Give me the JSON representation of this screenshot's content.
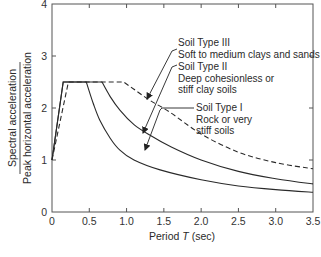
{
  "chart_data": {
    "type": "line",
    "title": "",
    "xlabel": "Period T (sec)",
    "xlabel_parts": {
      "prefix": "Period ",
      "italic": "T",
      "suffix": " (sec)"
    },
    "ylabel": "Spectral acceleration / Peak horizontal acceleration",
    "ylabel_numerator": "Spectral acceleration",
    "ylabel_denominator": "Peak horizontal acceleration",
    "xlim": [
      0,
      3.5
    ],
    "ylim": [
      0,
      4
    ],
    "xticks": [
      0,
      0.5,
      1.0,
      1.5,
      2.0,
      2.5,
      3.0,
      3.5
    ],
    "xtick_labels": [
      "0",
      "0.5",
      "1.0",
      "1.5",
      "2.0",
      "2.5",
      "3.0",
      "3.5"
    ],
    "yticks": [
      0,
      1,
      2,
      3,
      4
    ],
    "ytick_labels": [
      "0",
      "1",
      "2",
      "3",
      "4"
    ],
    "grid": false,
    "legend": "inline annotations with arrows",
    "series": [
      {
        "name": "Soil Type I",
        "description": "Rock or very stiff soils",
        "style": "solid",
        "points": [
          [
            0,
            1.0
          ],
          [
            0.15,
            2.5
          ],
          [
            0.46,
            2.5
          ],
          [
            0.55,
            2.1
          ],
          [
            0.64,
            1.77
          ],
          [
            0.78,
            1.42
          ],
          [
            0.91,
            1.19
          ],
          [
            1.1,
            1.0
          ],
          [
            1.45,
            0.81
          ],
          [
            2.0,
            0.62
          ],
          [
            2.5,
            0.5
          ],
          [
            3.0,
            0.43
          ],
          [
            3.5,
            0.38
          ]
        ]
      },
      {
        "name": "Soil Type II",
        "description": "Deep cohesionless or stiff clay soils",
        "style": "solid",
        "points": [
          [
            0,
            1.0
          ],
          [
            0.15,
            2.5
          ],
          [
            0.67,
            2.5
          ],
          [
            0.78,
            2.22
          ],
          [
            0.91,
            1.96
          ],
          [
            1.1,
            1.68
          ],
          [
            1.31,
            1.48
          ],
          [
            1.6,
            1.25
          ],
          [
            2.0,
            1.0
          ],
          [
            2.5,
            0.78
          ],
          [
            3.0,
            0.64
          ],
          [
            3.5,
            0.54
          ]
        ]
      },
      {
        "name": "Soil Type III",
        "description": "Soft to medium clays and sands",
        "style": "dashed",
        "points": [
          [
            0,
            1.0
          ],
          [
            0.22,
            2.5
          ],
          [
            0.96,
            2.5
          ],
          [
            1.1,
            2.36
          ],
          [
            1.31,
            2.15
          ],
          [
            1.58,
            1.92
          ],
          [
            2.0,
            1.5
          ],
          [
            2.5,
            1.15
          ],
          [
            3.0,
            0.95
          ],
          [
            3.5,
            0.83
          ]
        ]
      }
    ],
    "annotations": [
      {
        "lines": [
          "Soil Type III",
          "Soft to medium clays and sands"
        ]
      },
      {
        "lines": [
          "Soil Type II",
          "Deep cohesionless or",
          "stiff clay soils"
        ]
      },
      {
        "lines": [
          "Soil Type I",
          "Rock or very",
          "stiff soils"
        ]
      }
    ]
  }
}
